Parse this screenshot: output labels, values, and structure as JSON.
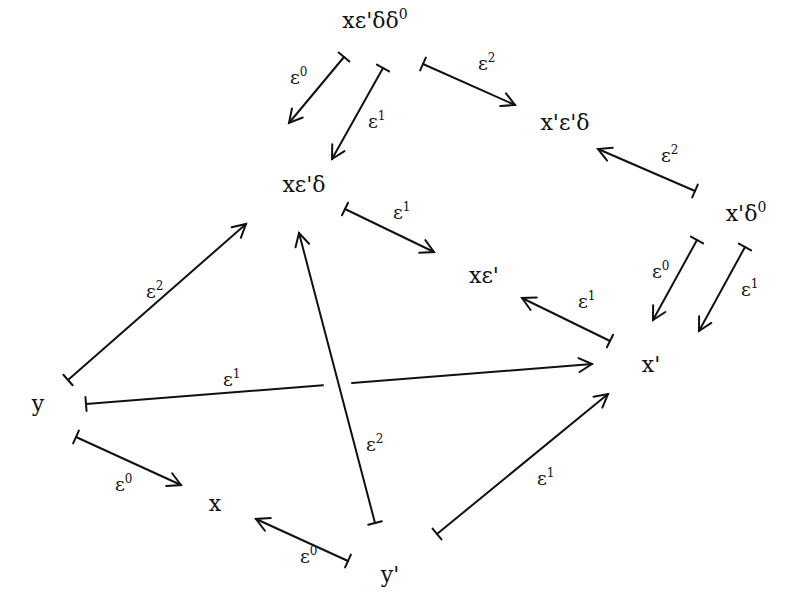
{
  "diagram": {
    "nodes": [
      {
        "id": "xe1dd0",
        "text": "xε'δδ⁰",
        "x": 375,
        "y": 28
      },
      {
        "id": "x1e1d",
        "text": "x'ε'δ",
        "x": 565,
        "y": 130
      },
      {
        "id": "xe1d",
        "text": "xε'δ",
        "x": 304,
        "y": 192
      },
      {
        "id": "x1d0",
        "text": "x'δ⁰",
        "x": 746,
        "y": 221
      },
      {
        "id": "xe1",
        "text": "xε'",
        "x": 484,
        "y": 283
      },
      {
        "id": "x1",
        "text": "x'",
        "x": 651,
        "y": 372
      },
      {
        "id": "y",
        "text": "y",
        "x": 38,
        "y": 411
      },
      {
        "id": "x",
        "text": "x",
        "x": 215,
        "y": 511
      },
      {
        "id": "y1",
        "text": "y'",
        "x": 390,
        "y": 582
      }
    ],
    "edges": [
      {
        "from": "xe1dd0",
        "to": "xe1d",
        "label": "ε⁰",
        "x1": 344,
        "y1": 57,
        "x2": 289,
        "y2": 123,
        "lx": 290,
        "ly": 84
      },
      {
        "from": "xe1dd0",
        "to": "xe1d",
        "label": "ε¹",
        "x1": 383,
        "y1": 68,
        "x2": 332,
        "y2": 159,
        "lx": 368,
        "ly": 128
      },
      {
        "from": "xe1dd0",
        "to": "x1e1d",
        "label": "ε²",
        "x1": 423,
        "y1": 64,
        "x2": 515,
        "y2": 105,
        "lx": 478,
        "ly": 70
      },
      {
        "from": "x1d0",
        "to": "x1e1d",
        "label": "ε²",
        "x1": 695,
        "y1": 191,
        "x2": 598,
        "y2": 149,
        "lx": 661,
        "ly": 162
      },
      {
        "from": "xe1d",
        "to": "xe1",
        "label": "ε¹",
        "x1": 345,
        "y1": 209,
        "x2": 434,
        "y2": 252,
        "lx": 393,
        "ly": 219
      },
      {
        "from": "x1",
        "to": "xe1",
        "label": "ε¹",
        "x1": 610,
        "y1": 341,
        "x2": 522,
        "y2": 298,
        "lx": 578,
        "ly": 308
      },
      {
        "from": "x1d0",
        "to": "x1",
        "label": "ε⁰",
        "x1": 697,
        "y1": 240,
        "x2": 653,
        "y2": 320,
        "lx": 652,
        "ly": 278
      },
      {
        "from": "x1d0",
        "to": "x1",
        "label": "ε¹",
        "x1": 745,
        "y1": 247,
        "x2": 699,
        "y2": 331,
        "lx": 741,
        "ly": 296
      },
      {
        "from": "y",
        "to": "xe1d",
        "label": "ε²",
        "x1": 68,
        "y1": 380,
        "x2": 246,
        "y2": 224,
        "lx": 146,
        "ly": 298
      },
      {
        "from": "y",
        "to": "x1",
        "label": "ε¹",
        "x1": 86,
        "y1": 404,
        "x2": 592,
        "y2": 364,
        "lx": 223,
        "ly": 386,
        "gap": [
          323,
          352
        ]
      },
      {
        "from": "y1",
        "to": "xe1d",
        "label": "ε²",
        "x1": 375,
        "y1": 523,
        "x2": 299,
        "y2": 233,
        "lx": 366,
        "ly": 451
      },
      {
        "from": "y",
        "to": "x",
        "label": "ε⁰",
        "x1": 76,
        "y1": 437,
        "x2": 181,
        "y2": 485,
        "lx": 115,
        "ly": 491
      },
      {
        "from": "y1",
        "to": "x",
        "label": "ε⁰",
        "x1": 348,
        "y1": 561,
        "x2": 256,
        "y2": 519,
        "lx": 300,
        "ly": 563
      },
      {
        "from": "y1",
        "to": "x1",
        "label": "ε¹",
        "x1": 437,
        "y1": 534,
        "x2": 608,
        "y2": 394,
        "lx": 537,
        "ly": 485
      }
    ]
  }
}
